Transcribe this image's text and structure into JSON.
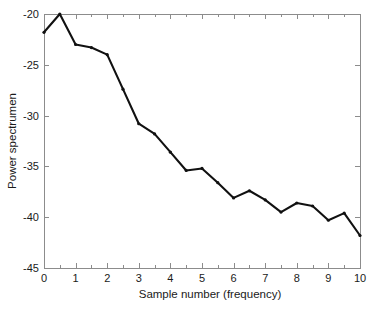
{
  "chart_data": {
    "type": "line",
    "title": "",
    "subtitle": "",
    "xlabel": "Sample number (frequency)",
    "ylabel": "Power spectrumen",
    "xlim": [
      0,
      10
    ],
    "ylim": [
      -45,
      -20
    ],
    "xticks": [
      0,
      1,
      2,
      3,
      4,
      5,
      6,
      7,
      8,
      9,
      10
    ],
    "xticklabels": [
      "0",
      "1",
      "2",
      "3",
      "4",
      "5",
      "6",
      "7",
      "8",
      "9",
      "10"
    ],
    "yticks": [
      -45,
      -40,
      -35,
      -30,
      -25,
      -20
    ],
    "yticklabels": [
      "-45",
      "-40",
      "-35",
      "-30",
      "-25",
      "-20"
    ],
    "minor_xticks": [
      0.5,
      1.5,
      2.5,
      3.5,
      4.5,
      5.5,
      6.5,
      7.5,
      8.5,
      9.5
    ],
    "grid": false,
    "legend": null,
    "legend_position": "none",
    "line_color": "#111111",
    "axis_color": "#8c8c8c",
    "background_color": "#ffffff",
    "marker": "point",
    "series": [
      {
        "name": "Power spectrum",
        "x": [
          0,
          0.5,
          1,
          1.5,
          2,
          2.5,
          3,
          3.5,
          4,
          4.5,
          5,
          5.5,
          6,
          6.5,
          7,
          7.5,
          8,
          8.5,
          9,
          9.5,
          10
        ],
        "values": [
          -21.8,
          -20.0,
          -23.0,
          -23.3,
          -24.0,
          -27.4,
          -30.8,
          -31.8,
          -33.6,
          -35.4,
          -35.2,
          -36.6,
          -38.1,
          -37.4,
          -38.3,
          -39.5,
          -38.6,
          -38.9,
          -40.3,
          -39.6,
          -41.8
        ]
      }
    ]
  }
}
